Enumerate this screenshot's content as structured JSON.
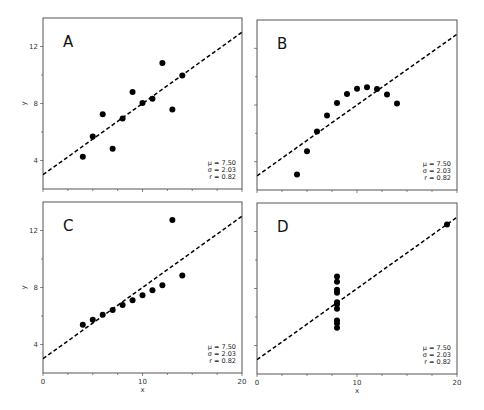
{
  "chart_data": [
    {
      "type": "scatter",
      "panel_label": "A",
      "x": [
        10,
        8,
        13,
        9,
        11,
        14,
        6,
        4,
        12,
        7,
        5
      ],
      "y": [
        8.04,
        6.95,
        7.58,
        8.81,
        8.33,
        9.96,
        7.24,
        4.26,
        10.84,
        4.82,
        5.68
      ],
      "fit_line": {
        "intercept": 3.0,
        "slope": 0.5,
        "style": "dashed"
      },
      "stats": {
        "mu": "μ = 7.50",
        "sigma": "σ = 2.03",
        "r": "r = 0.82"
      },
      "xlabel": "",
      "ylabel": "y",
      "xlim": [
        0,
        20
      ],
      "ylim": [
        2,
        14
      ],
      "xticks": [],
      "yticks": [
        "4",
        "8",
        "12"
      ]
    },
    {
      "type": "scatter",
      "panel_label": "B",
      "x": [
        10,
        8,
        13,
        9,
        11,
        14,
        6,
        4,
        12,
        7,
        5
      ],
      "y": [
        9.14,
        8.14,
        8.74,
        8.77,
        9.26,
        8.1,
        6.13,
        3.1,
        9.13,
        7.26,
        4.74
      ],
      "fit_line": {
        "intercept": 3.0,
        "slope": 0.5,
        "style": "dashed"
      },
      "stats": {
        "mu": "μ = 7.50",
        "sigma": "σ = 2.03",
        "r": "r = 0.82"
      },
      "xlabel": "",
      "ylabel": "",
      "xlim": [
        0,
        20
      ],
      "ylim": [
        2,
        14
      ],
      "xticks": [],
      "yticks": []
    },
    {
      "type": "scatter",
      "panel_label": "C",
      "x": [
        10,
        8,
        13,
        9,
        11,
        14,
        6,
        4,
        12,
        7,
        5
      ],
      "y": [
        7.46,
        6.77,
        12.74,
        7.11,
        7.81,
        8.84,
        6.08,
        5.39,
        8.15,
        6.42,
        5.73
      ],
      "fit_line": {
        "intercept": 3.0,
        "slope": 0.5,
        "style": "dashed"
      },
      "stats": {
        "mu": "μ = 7.50",
        "sigma": "σ = 2.03",
        "r": "r = 0.82"
      },
      "xlabel": "x",
      "ylabel": "y",
      "xlim": [
        0,
        20
      ],
      "ylim": [
        2,
        14
      ],
      "xticks": [
        "0",
        "10",
        "20"
      ],
      "yticks": [
        "4",
        "8",
        "12"
      ]
    },
    {
      "type": "scatter",
      "panel_label": "D",
      "x": [
        8,
        8,
        8,
        8,
        8,
        8,
        8,
        19,
        8,
        8,
        8
      ],
      "y": [
        6.58,
        5.76,
        7.71,
        8.84,
        8.47,
        7.04,
        5.25,
        12.5,
        5.56,
        7.91,
        6.89
      ],
      "fit_line": {
        "intercept": 3.0,
        "slope": 0.5,
        "style": "dashed"
      },
      "stats": {
        "mu": "μ = 7.50",
        "sigma": "σ = 2.03",
        "r": "r = 0.82"
      },
      "xlabel": "x",
      "ylabel": "",
      "xlim": [
        0,
        20
      ],
      "ylim": [
        2,
        14
      ],
      "xticks": [
        "0",
        "10",
        "20"
      ],
      "yticks": []
    }
  ],
  "layout": {
    "panels": [
      {
        "left": 43,
        "top": 18,
        "right": 242,
        "bottom": 189
      },
      {
        "left": 257,
        "top": 20,
        "right": 457,
        "bottom": 190
      },
      {
        "left": 43,
        "top": 202,
        "right": 242,
        "bottom": 373
      },
      {
        "left": 257,
        "top": 203,
        "right": 457,
        "bottom": 374
      }
    ],
    "colors": {
      "frame": "#555555",
      "points": "#000000",
      "line": "#000000"
    }
  }
}
